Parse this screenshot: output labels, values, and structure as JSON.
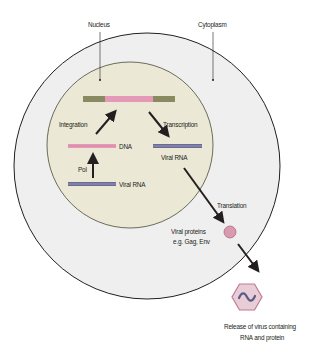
{
  "labels": {
    "nucleus": "Nucleus",
    "cytoplasm": "Cytoplasm",
    "integration": "Integration",
    "transcription": "Transcription",
    "dna": "DNA",
    "pol": "Pol",
    "viral_rna_bottom": "Viral RNA",
    "viral_rna_right": "Viral RNA",
    "translation": "Translation",
    "viral_proteins_line1": "Viral proteins",
    "viral_proteins_line2": "e.g. Gag, Env",
    "release_line1": "Release of virus containing",
    "release_line2": "RNA and protein"
  },
  "colors": {
    "cytoplasm_fill": "#efefef",
    "nucleus_fill": "#ebe8d5",
    "membrane_stroke": "#231f20",
    "dna_pink": "#e49ab6",
    "host_dna_olive": "#8a8a62",
    "rna_purple": "#6a6a96",
    "protein_fill": "#d99ab0",
    "virus_fill": "#e9cdd6",
    "virus_stroke": "#c07a92",
    "arrow": "#231f20"
  }
}
